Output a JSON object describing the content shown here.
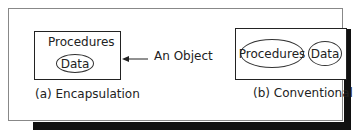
{
  "encapsulation": {
    "box_label": "Procedures",
    "ellipse_label": "Data",
    "caption": "(a) Encapsulation"
  },
  "pointer": {
    "label": "An Object"
  },
  "conventional": {
    "ellipse1_label": "Procedures",
    "ellipse2_label": "Data",
    "caption": "(b) Conventional"
  }
}
